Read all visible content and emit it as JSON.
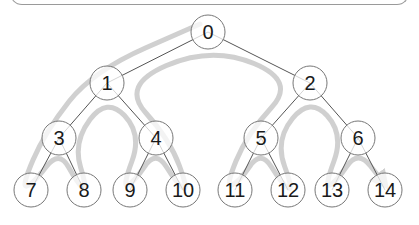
{
  "diagram": {
    "type": "binary-tree-traversal",
    "colors": {
      "edge": "#555555",
      "node_stroke": "#777777",
      "node_fill": "#ffffff",
      "path": "#c8c8c8",
      "label": "#1a1a1a"
    },
    "nodes": [
      {
        "id": 0,
        "label": "0",
        "x": 208,
        "y": 32
      },
      {
        "id": 1,
        "label": "1",
        "x": 107,
        "y": 83
      },
      {
        "id": 2,
        "label": "2",
        "x": 310,
        "y": 83
      },
      {
        "id": 3,
        "label": "3",
        "x": 59,
        "y": 138
      },
      {
        "id": 4,
        "label": "4",
        "x": 156,
        "y": 138
      },
      {
        "id": 5,
        "label": "5",
        "x": 261,
        "y": 138
      },
      {
        "id": 6,
        "label": "6",
        "x": 358,
        "y": 138
      },
      {
        "id": 7,
        "label": "7",
        "x": 31,
        "y": 190
      },
      {
        "id": 8,
        "label": "8",
        "x": 84,
        "y": 190
      },
      {
        "id": 9,
        "label": "9",
        "x": 130,
        "y": 190
      },
      {
        "id": 10,
        "label": "10",
        "x": 183,
        "y": 190
      },
      {
        "id": 11,
        "label": "11",
        "x": 235,
        "y": 190
      },
      {
        "id": 12,
        "label": "12",
        "x": 288,
        "y": 190
      },
      {
        "id": 13,
        "label": "13",
        "x": 332,
        "y": 190
      },
      {
        "id": 14,
        "label": "14",
        "x": 385,
        "y": 190
      }
    ],
    "edges": [
      [
        0,
        1
      ],
      [
        0,
        2
      ],
      [
        1,
        3
      ],
      [
        1,
        4
      ],
      [
        2,
        5
      ],
      [
        2,
        6
      ],
      [
        3,
        7
      ],
      [
        3,
        8
      ],
      [
        4,
        9
      ],
      [
        4,
        10
      ],
      [
        5,
        11
      ],
      [
        5,
        12
      ],
      [
        6,
        13
      ],
      [
        6,
        14
      ]
    ]
  }
}
